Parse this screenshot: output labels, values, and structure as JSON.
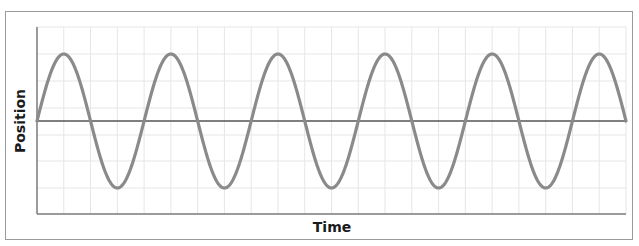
{
  "chart_data": {
    "type": "line",
    "title": "",
    "xlabel": "Time",
    "ylabel": "Position",
    "grid": true,
    "legend": null,
    "series": [
      {
        "name": "position",
        "function": "sine",
        "amplitude": 1,
        "cycles": 5.5,
        "phase_start": 0,
        "color": "#8a8a8a"
      },
      {
        "name": "equilibrium",
        "function": "constant",
        "value": 0,
        "color": "#555555"
      }
    ],
    "x_range": [
      0,
      5.5
    ],
    "y_range": [
      -1.45,
      1.45
    ],
    "tick_labels": {
      "x": [],
      "y": []
    }
  },
  "labels": {
    "x_axis": "Time",
    "y_axis": "Position"
  },
  "colors": {
    "wave": "#8a8a8a",
    "zero_line": "#555555",
    "axis": "#7a7a7a",
    "grid": "#e6e6e6",
    "frame": "#9a9a9a"
  }
}
